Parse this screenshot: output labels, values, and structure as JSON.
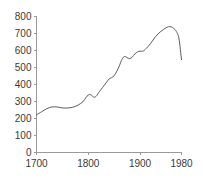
{
  "chart_data": {
    "type": "line",
    "title": "",
    "subtitle": "",
    "xlabel": "",
    "ylabel": "",
    "xlim": [
      1700,
      1980
    ],
    "ylim": [
      0,
      800
    ],
    "grid": false,
    "legend": null,
    "legend_position": "none",
    "x_ticks": [
      1700,
      1800,
      1900,
      1980
    ],
    "x_tick_labels": [
      "1700",
      "1800",
      "1900",
      "1980"
    ],
    "y_ticks": [
      0,
      100,
      200,
      300,
      400,
      500,
      600,
      700,
      800
    ],
    "y_tick_labels": [
      "0",
      "100",
      "200",
      "300",
      "400",
      "500",
      "600",
      "700",
      "800"
    ],
    "line_color": "#5a5a5a",
    "axis_color": "#9a9a9a",
    "text_color": "#3a3a3a",
    "series": [
      {
        "name": "series-1",
        "x": [
          1700,
          1710,
          1720,
          1730,
          1740,
          1750,
          1760,
          1770,
          1780,
          1790,
          1795,
          1800,
          1805,
          1810,
          1815,
          1820,
          1830,
          1840,
          1845,
          1850,
          1855,
          1860,
          1865,
          1870,
          1875,
          1880,
          1885,
          1890,
          1895,
          1900,
          1905,
          1910,
          1920,
          1930,
          1940,
          1950,
          1955,
          1960,
          1965,
          1970,
          1975,
          1980
        ],
        "y": [
          222,
          240,
          258,
          268,
          268,
          262,
          262,
          266,
          278,
          300,
          322,
          338,
          340,
          326,
          330,
          352,
          392,
          432,
          440,
          452,
          478,
          510,
          548,
          565,
          558,
          552,
          562,
          580,
          592,
          596,
          596,
          606,
          640,
          682,
          712,
          733,
          740,
          739,
          730,
          712,
          672,
          546
        ]
      }
    ]
  }
}
